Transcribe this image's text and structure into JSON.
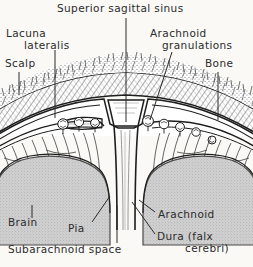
{
  "figure": {
    "title": "Superior sagittal sinus",
    "background_color": "#faf9f6",
    "ink_color": "#2b2b2b"
  },
  "labels": {
    "title": "Superior sagittal sinus",
    "lacuna_line1": "Lacuna",
    "lacuna_line2": "lateralis",
    "scalp": "Scalp",
    "granulations_line1": "Arachnoid",
    "granulations_line2": "granulations",
    "bone": "Bone",
    "brain": "Brain",
    "pia": "Pia",
    "subarachnoid_space": "Subarachnoid space",
    "arachnoid": "Arachnoid",
    "dura_line1": "Dura (falx",
    "dura_line2": "cerebri)"
  },
  "structures": {
    "scalp": {
      "name": "scalp",
      "fill": "#ffffff",
      "texture": "hair-stipple"
    },
    "bone": {
      "name": "bone",
      "fill": "#f2f0ec",
      "texture": "diagonal-hatch-diploe"
    },
    "dura": {
      "name": "dura-mater",
      "stroke": "#1d1d1d"
    },
    "sinus": {
      "name": "superior-sagittal-sinus",
      "fill": "#ffffff",
      "shape": "triangular-apex-cavity"
    },
    "lacuna": {
      "name": "lacuna-lateralis",
      "fill": "#ffffff"
    },
    "arachnoid": {
      "name": "arachnoid-membrane",
      "stroke": "#1d1d1d"
    },
    "granulations": {
      "name": "arachnoid-granulations",
      "count": 8
    },
    "subarachnoid": {
      "name": "subarachnoid-space",
      "texture": "trabeculae"
    },
    "falx": {
      "name": "falx-cerebri",
      "orientation": "vertical-midline"
    },
    "brain": {
      "name": "brain-gyri",
      "fill": "#c9c9c9",
      "texture": "stipple",
      "count": 2
    },
    "pia": {
      "name": "pia-mater",
      "stroke": "#1d1d1d"
    }
  }
}
